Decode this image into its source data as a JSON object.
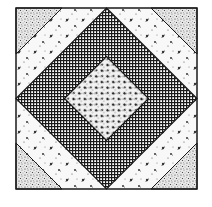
{
  "figure": {
    "block": {
      "x": 16,
      "y": 8,
      "size": 181
    },
    "center": {
      "x": 106.5,
      "y": 98.5
    },
    "inner_diamond_half_diagonal": 42,
    "corner_triangle_leg": 46,
    "colors": {
      "background": "#ffffff",
      "ink": "#1a1a1a",
      "paper": "#f6f6f6"
    },
    "patches": [
      {
        "name": "corner-top-left",
        "fabric": "stipple"
      },
      {
        "name": "corner-top-right",
        "fabric": "stipple"
      },
      {
        "name": "corner-bottom-left",
        "fabric": "stipple"
      },
      {
        "name": "corner-bottom-right",
        "fabric": "stipple"
      },
      {
        "name": "stripe-top-left",
        "fabric": "floral-sparse"
      },
      {
        "name": "stripe-top-right",
        "fabric": "floral-sparse"
      },
      {
        "name": "stripe-bottom-left",
        "fabric": "floral-sparse"
      },
      {
        "name": "stripe-bottom-right",
        "fabric": "floral-sparse"
      },
      {
        "name": "grid-band",
        "fabric": "grid-check"
      },
      {
        "name": "center-diamond",
        "fabric": "floral-dense"
      }
    ]
  }
}
